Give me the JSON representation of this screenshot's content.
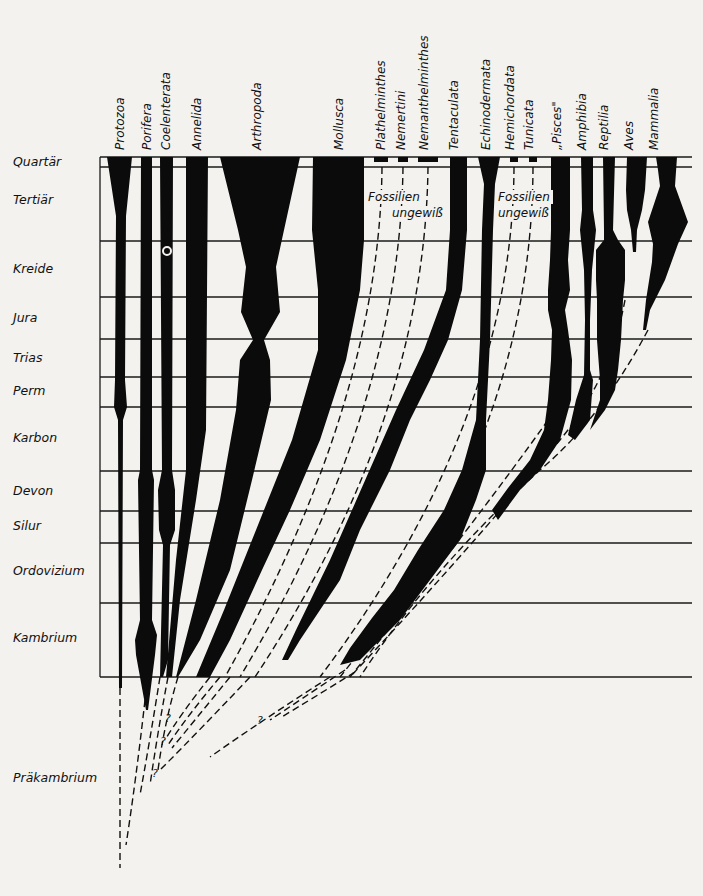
{
  "figure": {
    "type": "phylogenetic-range-chart",
    "taxa": [
      {
        "name": "Protozoa"
      },
      {
        "name": "Porifera"
      },
      {
        "name": "Coelenterata"
      },
      {
        "name": "Annelida"
      },
      {
        "name": "Arthropoda"
      },
      {
        "name": "Mollusca"
      },
      {
        "name": "Plathelminthes"
      },
      {
        "name": "Nemertini"
      },
      {
        "name": "Nemanthelminthes"
      },
      {
        "name": "Tentaculata"
      },
      {
        "name": "Echinodermata"
      },
      {
        "name": "Hemichordata"
      },
      {
        "name": "Tunicata"
      },
      {
        "name": "„Pisces\""
      },
      {
        "name": "Amphibia"
      },
      {
        "name": "Reptilia"
      },
      {
        "name": "Aves"
      },
      {
        "name": "Mammalia"
      }
    ],
    "periods": [
      {
        "name": "Quartär"
      },
      {
        "name": "Tertiär"
      },
      {
        "name": "Kreide"
      },
      {
        "name": "Jura"
      },
      {
        "name": "Trias"
      },
      {
        "name": "Perm"
      },
      {
        "name": "Karbon"
      },
      {
        "name": "Devon"
      },
      {
        "name": "Silur"
      },
      {
        "name": "Ordovizium"
      },
      {
        "name": "Kambrium"
      },
      {
        "name": "Präkambrium"
      }
    ],
    "annotations": {
      "fossils_uncertain_1_line1": "Fossilien",
      "fossils_uncertain_1_line2": "ungewiß",
      "fossils_uncertain_2_line1": "Fossilien",
      "fossils_uncertain_2_line2": "ungewiß",
      "question_mark": "?",
      "question_mark_2": "?",
      "question_mark_3": "?",
      "question_mark_4": "?"
    }
  }
}
